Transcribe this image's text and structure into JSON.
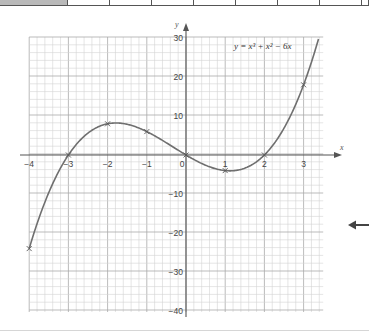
{
  "top_table": {
    "cells": [
      {
        "x": 0,
        "w": 68,
        "shaded": true
      },
      {
        "x": 68,
        "w": 42,
        "shaded": false
      },
      {
        "x": 110,
        "w": 42,
        "shaded": false
      },
      {
        "x": 152,
        "w": 42,
        "shaded": false
      },
      {
        "x": 194,
        "w": 42,
        "shaded": false
      },
      {
        "x": 236,
        "w": 42,
        "shaded": false
      },
      {
        "x": 278,
        "w": 42,
        "shaded": false
      },
      {
        "x": 320,
        "w": 42,
        "shaded": false
      },
      {
        "x": 362,
        "w": 7,
        "shaded": false
      }
    ]
  },
  "chart_data": {
    "type": "line",
    "title": "",
    "equation_label": "y = x³ + x² − 6x",
    "xlabel": "x",
    "ylabel": "y",
    "xlim": [
      -4,
      3.5
    ],
    "ylim": [
      -40,
      30
    ],
    "grid": true,
    "x_ticks": [
      -4,
      -3,
      -2,
      -1,
      0,
      1,
      2,
      3
    ],
    "x_tick_labels": [
      "−4",
      "−3",
      "−2",
      "−1",
      "0",
      "1",
      "2",
      "3"
    ],
    "y_ticks": [
      30,
      20,
      10,
      -10,
      -20,
      -30,
      -40
    ],
    "y_tick_labels": [
      "30",
      "20",
      "10",
      "−10",
      "−20",
      "−30",
      "−40"
    ],
    "marked_points": {
      "x": [
        -4,
        -3,
        -2,
        -1,
        0,
        1,
        2,
        3
      ],
      "y": [
        -24,
        0,
        8,
        6,
        0,
        -4,
        0,
        18
      ]
    },
    "series": [
      {
        "name": "y = x³ + x² − 6x",
        "function": "x^3 + x^2 - 6x",
        "x_range": [
          -4,
          3.4
        ],
        "color": "#6f6f6f"
      }
    ]
  },
  "annotations": {
    "side_arrow": "left-arrow"
  }
}
